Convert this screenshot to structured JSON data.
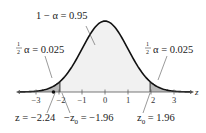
{
  "chart_data": {
    "type": "area",
    "title": "",
    "xlabel": "z",
    "ylabel": "",
    "distribution": "standard normal",
    "xlim": [
      -3.7,
      3.7
    ],
    "ticks": [
      -3,
      -2,
      -1,
      0,
      1,
      2,
      3
    ],
    "tick_labels": [
      "−3",
      "−2",
      "−1",
      "0",
      "1",
      "2",
      "3"
    ],
    "regions": [
      {
        "name": "left-tail",
        "from": -3.7,
        "to": -1.96,
        "area": 0.025,
        "shade": "#b9b9b9"
      },
      {
        "name": "center",
        "from": -1.96,
        "to": 1.96,
        "area": 0.95,
        "shade": "#f1f1f1"
      },
      {
        "name": "right-tail",
        "from": 1.96,
        "to": 3.7,
        "area": 0.025,
        "shade": "#b9b9b9"
      }
    ],
    "critical_values": [
      -1.96,
      1.96
    ],
    "test_statistic": -2.24,
    "annotations": {
      "center_label": "1 − α = 0.95",
      "left_tail_frac_num": "1",
      "left_tail_frac_den": "2",
      "left_tail_label": "α = 0.025",
      "right_tail_frac_num": "1",
      "right_tail_frac_den": "2",
      "right_tail_label": "α = 0.025",
      "test_stat_label": "z = −2.24",
      "neg_crit_prefix": "−z",
      "neg_crit_sub": "0",
      "neg_crit_value": " = −1.96",
      "pos_crit_prefix": "z",
      "pos_crit_sub": "0",
      "pos_crit_value": " = 1.96"
    },
    "colors": {
      "curve": "#111111",
      "axis": "#555555",
      "tail": "#b9b9b9",
      "center": "#f1f1f1"
    }
  }
}
